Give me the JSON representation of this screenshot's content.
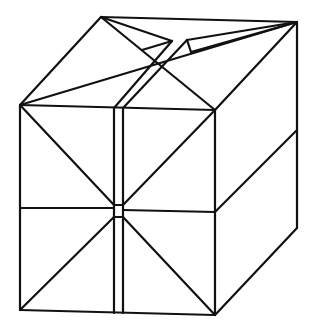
{
  "diagram": {
    "stroke_color": "#111111",
    "background_color": "#ffffff",
    "groups": [
      {
        "name": "outline",
        "lines": [
          [
            20,
            105,
            215,
            110
          ],
          [
            215,
            110,
            215,
            315
          ],
          [
            215,
            315,
            20,
            310
          ],
          [
            20,
            310,
            20,
            105
          ],
          [
            20,
            105,
            101,
            17
          ],
          [
            101,
            17,
            297,
            22
          ],
          [
            297,
            22,
            215,
            110
          ],
          [
            297,
            22,
            297,
            228
          ],
          [
            297,
            228,
            215,
            315
          ]
        ]
      },
      {
        "name": "top-face-folds",
        "lines": [
          [
            101,
            17,
            215,
            110
          ],
          [
            20,
            105,
            297,
            22
          ],
          [
            101,
            17,
            172,
            41
          ],
          [
            172,
            41,
            142,
            50
          ],
          [
            172,
            41,
            114,
            108
          ],
          [
            187,
            40,
            123,
            108
          ],
          [
            187,
            40,
            191,
            52
          ],
          [
            191,
            52,
            297,
            22
          ],
          [
            187,
            40,
            297,
            22
          ]
        ]
      },
      {
        "name": "front-face-folds",
        "lines": [
          [
            20,
            105,
            114,
            205
          ],
          [
            123,
            205,
            215,
            110
          ],
          [
            20,
            310,
            114,
            217
          ],
          [
            123,
            217,
            215,
            315
          ],
          [
            20,
            208,
            114,
            208
          ],
          [
            123,
            210,
            215,
            212
          ],
          [
            114,
            108,
            114,
            313
          ],
          [
            123,
            108,
            123,
            313
          ],
          [
            114,
            205,
            123,
            205
          ],
          [
            114,
            217,
            123,
            217
          ]
        ]
      },
      {
        "name": "right-face-folds",
        "lines": [
          [
            215,
            212,
            297,
            130
          ]
        ]
      }
    ]
  }
}
